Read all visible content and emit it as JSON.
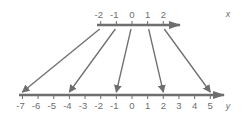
{
  "diagram": {
    "colors": {
      "line": "#6e6e6e",
      "text": "#6e6e6e",
      "background": "#ffffff"
    },
    "top_axis": {
      "name": "x",
      "labels": [
        "-2",
        "-1",
        "0",
        "1",
        "2"
      ],
      "values": [
        -2,
        -1,
        0,
        1,
        2
      ]
    },
    "bottom_axis": {
      "name": "y",
      "labels": [
        "-7",
        "-6",
        "-5",
        "-4",
        "-3",
        "-2",
        "-1",
        "0",
        "1",
        "2",
        "3",
        "4",
        "5"
      ],
      "values": [
        -7,
        -6,
        -5,
        -4,
        -3,
        -2,
        -1,
        0,
        1,
        2,
        3,
        4,
        5
      ]
    },
    "mappings": [
      {
        "from": -2,
        "to": -7
      },
      {
        "from": -1,
        "to": -4
      },
      {
        "from": 0,
        "to": -1
      },
      {
        "from": 1,
        "to": 2
      },
      {
        "from": 2,
        "to": 5
      }
    ]
  }
}
